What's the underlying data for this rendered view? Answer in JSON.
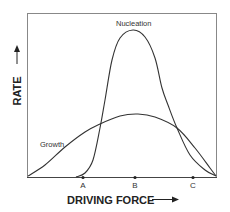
{
  "chart_data": {
    "type": "line",
    "title": "",
    "xlabel": "DRIVING FORCE",
    "ylabel": "RATE",
    "x_ticks": [
      {
        "label": "A",
        "x": 83
      },
      {
        "label": "B",
        "x": 135
      },
      {
        "label": "C",
        "x": 193
      }
    ],
    "series": [
      {
        "name": "Nucleation",
        "description": "narrow sharp peak centered near B",
        "points": [
          [
            76,
            177
          ],
          [
            85,
            173
          ],
          [
            93,
            160
          ],
          [
            100,
            128
          ],
          [
            105,
            100
          ],
          [
            112,
            60
          ],
          [
            120,
            38
          ],
          [
            133,
            30
          ],
          [
            145,
            37
          ],
          [
            155,
            58
          ],
          [
            162,
            88
          ],
          [
            168,
            105
          ],
          [
            177,
            128
          ],
          [
            190,
            155
          ],
          [
            205,
            170
          ],
          [
            216,
            176
          ]
        ]
      },
      {
        "name": "Growth",
        "description": "broad low peak centered slightly right of B",
        "points": [
          [
            28,
            176
          ],
          [
            45,
            165
          ],
          [
            65,
            147
          ],
          [
            85,
            132
          ],
          [
            100,
            124
          ],
          [
            120,
            116
          ],
          [
            138,
            114
          ],
          [
            155,
            117
          ],
          [
            177,
            128
          ],
          [
            195,
            148
          ],
          [
            210,
            168
          ],
          [
            216,
            176
          ]
        ]
      }
    ],
    "grid": false,
    "legend": "inline labels"
  },
  "labels": {
    "nucleation": "Nucleation",
    "growth": "Growth",
    "x_axis": "DRIVING FORCE",
    "y_axis": "RATE",
    "tick_a": "A",
    "tick_b": "B",
    "tick_c": "C"
  }
}
